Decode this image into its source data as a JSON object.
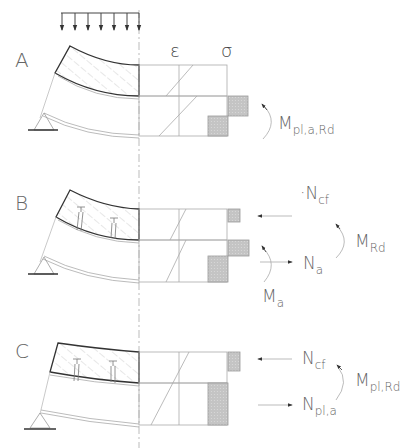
{
  "diagram": {
    "column_headers": {
      "strain": "ε",
      "stress": "σ"
    },
    "colors": {
      "outline": "#333333",
      "thin_line": "#aaaaaa",
      "hatch": "#c8c8c8",
      "stress_block": "#cccccc",
      "stress_block_edge": "#999999",
      "label": "#666666"
    },
    "load": {
      "type": "distributed-load",
      "arrow_count": 7
    },
    "cases": [
      {
        "id": "A",
        "label": "A",
        "shear_connectors": 0,
        "strain_diagram": "two separate linear segments (slab and steel)",
        "stress_blocks": [
          "steel top tension block",
          "steel bottom compression block"
        ],
        "forces": [],
        "moments": [
          {
            "symbol": "M",
            "subscript": "pl,a,Rd"
          }
        ]
      },
      {
        "id": "B",
        "label": "B",
        "shear_connectors": 2,
        "strain_diagram": "two separate linear segments (partial interaction)",
        "stress_blocks": [
          "slab compression block",
          "steel top block",
          "steel bottom block"
        ],
        "forces": [
          {
            "symbol": "N",
            "subscript": "cf",
            "prefix": "·",
            "direction": "left"
          },
          {
            "symbol": "N",
            "subscript": "a",
            "direction": "right"
          }
        ],
        "moments": [
          {
            "symbol": "M",
            "subscript": "Rd"
          },
          {
            "symbol": "M",
            "subscript": "a"
          }
        ]
      },
      {
        "id": "C",
        "label": "C",
        "shear_connectors": 2,
        "strain_diagram": "single continuous linear line (full interaction)",
        "stress_blocks": [
          "slab compression block",
          "full steel tension block"
        ],
        "forces": [
          {
            "symbol": "N",
            "subscript": "cf",
            "direction": "left"
          },
          {
            "symbol": "N",
            "subscript": "pl,a",
            "direction": "right"
          }
        ],
        "moments": [
          {
            "symbol": "M",
            "subscript": "pl,Rd"
          }
        ]
      }
    ]
  }
}
